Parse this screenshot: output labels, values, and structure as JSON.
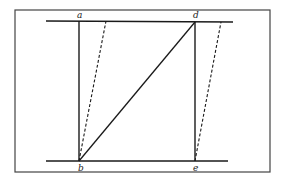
{
  "diagram": {
    "frame": {
      "x": 15,
      "y": 10,
      "width": 255,
      "height": 162,
      "stroke": "#444444"
    },
    "lines": {
      "top_rail": {
        "x1": 46,
        "y1": 21,
        "x2": 233,
        "y2": 22
      },
      "bottom_rail": {
        "x1": 46,
        "y1": 161,
        "x2": 228,
        "y2": 161
      },
      "ab": {
        "x1": 79,
        "y1": 21,
        "x2": 79,
        "y2": 161
      },
      "de": {
        "x1": 195,
        "y1": 22,
        "x2": 195,
        "y2": 161
      },
      "bd": {
        "x1": 79,
        "y1": 161,
        "x2": 195,
        "y2": 22
      },
      "b_dashed": {
        "x1": 79,
        "y1": 161,
        "x2": 106,
        "y2": 21
      },
      "e_dashed": {
        "x1": 195,
        "y1": 161,
        "x2": 221,
        "y2": 22
      }
    },
    "labels": {
      "a": {
        "text": "a",
        "x": 77,
        "y": 18
      },
      "d": {
        "text": "d",
        "x": 193,
        "y": 18
      },
      "b": {
        "text": "b",
        "x": 78,
        "y": 171
      },
      "e": {
        "text": "e",
        "x": 193,
        "y": 171
      }
    },
    "colors": {
      "line": "#1a1a1a",
      "frame": "#444444"
    }
  }
}
